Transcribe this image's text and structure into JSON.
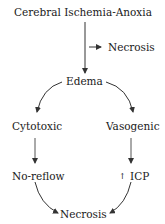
{
  "diagram": {
    "nodes": {
      "root": "Cerebral Ischemia-Anoxia",
      "necrosis_side": "Necrosis",
      "edema": "Edema",
      "cytotoxic": "Cytotoxic",
      "vasogenic": "Vasogenic",
      "noreflow": "No-reflow",
      "icp_prefix": "↑",
      "icp": "ICP",
      "necrosis_final": "Necrosis"
    },
    "edges": [
      {
        "from": "Cerebral Ischemia-Anoxia",
        "to": "Edema"
      },
      {
        "from": "Cerebral Ischemia-Anoxia",
        "to": "Necrosis"
      },
      {
        "from": "Edema",
        "to": "Cytotoxic"
      },
      {
        "from": "Edema",
        "to": "Vasogenic"
      },
      {
        "from": "Cytotoxic",
        "to": "No-reflow"
      },
      {
        "from": "Vasogenic",
        "to": "↑ ICP"
      },
      {
        "from": "No-reflow",
        "to": "Necrosis"
      },
      {
        "from": "↑ ICP",
        "to": "Necrosis"
      }
    ]
  }
}
